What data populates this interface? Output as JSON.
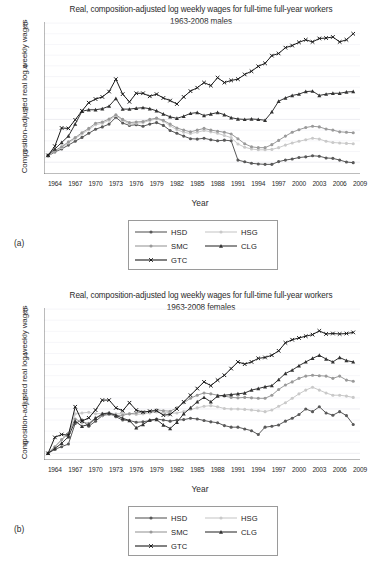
{
  "figure": {
    "panel_a_tag": "(a)",
    "panel_b_tag": "(b)"
  },
  "panels": [
    {
      "tag": "(a)",
      "title_line1": "Real, composition-adjusted log weekly wages for full-time full-year workers",
      "title_line2": "1963-2008 males",
      "ylabel": "Composition-adjusted real log weekly wages",
      "xlabel": "Year"
    },
    {
      "tag": "(b)",
      "title_line1": "Real, composition-adjusted log weekly wages for full-time full-year workers",
      "title_line2": "1963-2008 females",
      "ylabel": "Composition-adjusted real log weekly wages",
      "xlabel": "Year"
    }
  ],
  "legend": {
    "items": [
      {
        "label": "HSD",
        "marker": "circle",
        "color": "#595959"
      },
      {
        "label": "HSG",
        "marker": "circle",
        "color": "#c9c9c9"
      },
      {
        "label": "SMC",
        "marker": "circle",
        "color": "#9a9a9a"
      },
      {
        "label": "CLG",
        "marker": "triangle",
        "color": "#333333"
      },
      {
        "label": "GTC",
        "marker": "x",
        "color": "#1a1a1a"
      }
    ]
  },
  "chart_data": [
    {
      "type": "line",
      "panel": "(a)",
      "title": "Real, composition-adjusted log weekly wages for full-time full-year workers 1963-2008 males",
      "xlabel": "Year",
      "ylabel": "Composition-adjusted real log weekly wages",
      "xlim": [
        1962.4,
        2009.0
      ],
      "ylim": [
        -0.055,
        0.655
      ],
      "yticks": [
        0,
        0.2,
        0.4,
        0.6
      ],
      "ytick_labels": [
        "0",
        ".2",
        ".4",
        ".6"
      ],
      "xticks": [
        1964,
        1967,
        1970,
        1973,
        1976,
        1979,
        1982,
        1985,
        1988,
        1991,
        1994,
        1997,
        2000,
        2003,
        2006,
        2009
      ],
      "grid": true,
      "legend_position": "below",
      "x": [
        1963,
        1964,
        1965,
        1966,
        1967,
        1968,
        1969,
        1970,
        1971,
        1972,
        1973,
        1974,
        1975,
        1976,
        1977,
        1978,
        1979,
        1980,
        1981,
        1982,
        1983,
        1984,
        1985,
        1986,
        1987,
        1988,
        1989,
        1990,
        1991,
        1992,
        1993,
        1994,
        1995,
        1996,
        1997,
        1998,
        1999,
        2000,
        2001,
        2002,
        2003,
        2004,
        2005,
        2006,
        2007,
        2008
      ],
      "series": [
        {
          "name": "HSD",
          "marker": "circle",
          "color": "#595959",
          "values": [
            0.029,
            0.048,
            0.062,
            0.08,
            0.098,
            0.116,
            0.135,
            0.154,
            0.165,
            0.178,
            0.21,
            0.183,
            0.172,
            0.175,
            0.168,
            0.178,
            0.185,
            0.172,
            0.148,
            0.135,
            0.122,
            0.11,
            0.108,
            0.112,
            0.105,
            0.1,
            0.103,
            0.1,
            0.01,
            0.002,
            -0.005,
            -0.008,
            -0.01,
            -0.01,
            0.003,
            0.01,
            0.015,
            0.022,
            0.025,
            0.03,
            0.028,
            0.02,
            0.018,
            0.01,
            0.001,
            -0.002
          ]
        },
        {
          "name": "HSG",
          "marker": "circle",
          "color": "#c9c9c9",
          "values": [
            0.03,
            0.052,
            0.068,
            0.09,
            0.11,
            0.132,
            0.152,
            0.175,
            0.182,
            0.196,
            0.218,
            0.196,
            0.178,
            0.182,
            0.185,
            0.195,
            0.202,
            0.192,
            0.17,
            0.152,
            0.14,
            0.134,
            0.14,
            0.148,
            0.142,
            0.135,
            0.125,
            0.115,
            0.085,
            0.07,
            0.062,
            0.058,
            0.058,
            0.06,
            0.068,
            0.08,
            0.09,
            0.098,
            0.105,
            0.112,
            0.108,
            0.098,
            0.092,
            0.09,
            0.088,
            0.086
          ]
        },
        {
          "name": "SMC",
          "marker": "circle",
          "color": "#9a9a9a",
          "values": [
            0.032,
            0.055,
            0.072,
            0.095,
            0.115,
            0.138,
            0.158,
            0.182,
            0.188,
            0.202,
            0.222,
            0.2,
            0.185,
            0.188,
            0.19,
            0.2,
            0.206,
            0.196,
            0.178,
            0.16,
            0.15,
            0.142,
            0.15,
            0.158,
            0.15,
            0.145,
            0.14,
            0.132,
            0.11,
            0.086,
            0.072,
            0.068,
            0.068,
            0.082,
            0.102,
            0.122,
            0.14,
            0.152,
            0.162,
            0.168,
            0.165,
            0.155,
            0.15,
            0.142,
            0.14,
            0.138
          ]
        },
        {
          "name": "CLG",
          "marker": "triangle",
          "color": "#333333",
          "values": [
            0.034,
            0.062,
            0.092,
            0.122,
            0.178,
            0.238,
            0.245,
            0.245,
            0.25,
            0.262,
            0.298,
            0.248,
            0.248,
            0.252,
            0.255,
            0.25,
            0.24,
            0.225,
            0.212,
            0.205,
            0.215,
            0.228,
            0.232,
            0.218,
            0.225,
            0.232,
            0.222,
            0.208,
            0.202,
            0.2,
            0.202,
            0.2,
            0.196,
            0.235,
            0.285,
            0.3,
            0.312,
            0.318,
            0.33,
            0.332,
            0.312,
            0.318,
            0.322,
            0.322,
            0.328,
            0.33
          ]
        },
        {
          "name": "GTC",
          "marker": "x",
          "color": "#1a1a1a",
          "values": [
            0.032,
            0.075,
            0.16,
            0.158,
            0.198,
            0.24,
            0.278,
            0.295,
            0.305,
            0.33,
            0.388,
            0.318,
            0.282,
            0.322,
            0.322,
            0.308,
            0.318,
            0.3,
            0.288,
            0.272,
            0.305,
            0.332,
            0.348,
            0.372,
            0.358,
            0.395,
            0.372,
            0.382,
            0.388,
            0.41,
            0.425,
            0.448,
            0.462,
            0.498,
            0.508,
            0.535,
            0.545,
            0.56,
            0.572,
            0.562,
            0.578,
            0.58,
            0.585,
            0.562,
            0.572,
            0.6
          ]
        }
      ]
    },
    {
      "type": "line",
      "panel": "(b)",
      "title": "Real, composition-adjusted log weekly wages for full-time full-year workers 1963-2008 females",
      "xlabel": "Year",
      "ylabel": "Composition-adjusted real log weekly wages",
      "xlim": [
        1962.4,
        2009.0
      ],
      "ylim": [
        -0.03,
        0.655
      ],
      "yticks": [
        0,
        0.2,
        0.4,
        0.6
      ],
      "ytick_labels": [
        "0",
        ".2",
        ".4",
        ".6"
      ],
      "xticks": [
        1964,
        1967,
        1970,
        1973,
        1976,
        1979,
        1982,
        1985,
        1988,
        1991,
        1994,
        1997,
        2000,
        2003,
        2006,
        2009
      ],
      "grid": true,
      "legend_position": "below",
      "x": [
        1963,
        1964,
        1965,
        1966,
        1967,
        1968,
        1969,
        1970,
        1971,
        1972,
        1973,
        1974,
        1975,
        1976,
        1977,
        1978,
        1979,
        1980,
        1981,
        1982,
        1983,
        1984,
        1985,
        1986,
        1987,
        1988,
        1989,
        1990,
        1991,
        1992,
        1993,
        1994,
        1995,
        1996,
        1997,
        1998,
        1999,
        2000,
        2001,
        2002,
        2003,
        2004,
        2005,
        2006,
        2007,
        2008
      ],
      "series": [
        {
          "name": "HSD",
          "marker": "circle",
          "color": "#595959",
          "values": [
            0.0,
            0.018,
            0.03,
            0.042,
            0.135,
            0.15,
            0.122,
            0.145,
            0.17,
            0.182,
            0.165,
            0.15,
            0.148,
            0.14,
            0.142,
            0.148,
            0.155,
            0.15,
            0.145,
            0.15,
            0.152,
            0.158,
            0.155,
            0.148,
            0.142,
            0.138,
            0.125,
            0.118,
            0.118,
            0.11,
            0.102,
            0.085,
            0.118,
            0.122,
            0.128,
            0.145,
            0.158,
            0.175,
            0.2,
            0.188,
            0.21,
            0.182,
            0.172,
            0.188,
            0.17,
            0.13
          ]
        },
        {
          "name": "HSG",
          "marker": "circle",
          "color": "#c9c9c9",
          "values": [
            0.0,
            0.028,
            0.06,
            0.088,
            0.178,
            0.182,
            0.185,
            0.178,
            0.18,
            0.182,
            0.178,
            0.18,
            0.178,
            0.175,
            0.178,
            0.182,
            0.186,
            0.185,
            0.18,
            0.182,
            0.188,
            0.198,
            0.205,
            0.212,
            0.215,
            0.21,
            0.202,
            0.2,
            0.2,
            0.198,
            0.195,
            0.192,
            0.188,
            0.195,
            0.212,
            0.228,
            0.248,
            0.268,
            0.285,
            0.298,
            0.285,
            0.272,
            0.262,
            0.262,
            0.258,
            0.252
          ]
        },
        {
          "name": "SMC",
          "marker": "circle",
          "color": "#9a9a9a",
          "values": [
            0.0,
            0.03,
            0.062,
            0.09,
            0.155,
            0.14,
            0.135,
            0.16,
            0.17,
            0.175,
            0.17,
            0.172,
            0.178,
            0.182,
            0.186,
            0.19,
            0.196,
            0.192,
            0.19,
            0.205,
            0.228,
            0.248,
            0.262,
            0.272,
            0.268,
            0.262,
            0.258,
            0.252,
            0.25,
            0.252,
            0.25,
            0.248,
            0.248,
            0.262,
            0.288,
            0.308,
            0.322,
            0.338,
            0.348,
            0.352,
            0.35,
            0.348,
            0.338,
            0.348,
            0.33,
            0.325
          ]
        },
        {
          "name": "CLG",
          "marker": "triangle",
          "color": "#333333",
          "values": [
            0.0,
            0.022,
            0.045,
            0.075,
            0.145,
            0.122,
            0.13,
            0.158,
            0.178,
            0.182,
            0.172,
            0.158,
            0.148,
            0.115,
            0.13,
            0.15,
            0.152,
            0.128,
            0.112,
            0.14,
            0.178,
            0.205,
            0.232,
            0.252,
            0.232,
            0.258,
            0.262,
            0.265,
            0.268,
            0.272,
            0.285,
            0.292,
            0.3,
            0.305,
            0.332,
            0.36,
            0.375,
            0.395,
            0.412,
            0.428,
            0.442,
            0.425,
            0.412,
            0.432,
            0.418,
            0.412
          ]
        },
        {
          "name": "GTC",
          "marker": "x",
          "color": "#1a1a1a",
          "values": [
            0.0,
            0.072,
            0.085,
            0.082,
            0.21,
            0.145,
            0.16,
            0.195,
            0.24,
            0.24,
            0.205,
            0.192,
            0.228,
            0.195,
            0.185,
            0.19,
            0.192,
            0.172,
            0.175,
            0.2,
            0.232,
            0.262,
            0.292,
            0.322,
            0.305,
            0.33,
            0.352,
            0.382,
            0.412,
            0.402,
            0.412,
            0.428,
            0.432,
            0.442,
            0.462,
            0.498,
            0.512,
            0.52,
            0.528,
            0.535,
            0.552,
            0.538,
            0.54,
            0.538,
            0.54,
            0.545
          ]
        }
      ]
    }
  ]
}
